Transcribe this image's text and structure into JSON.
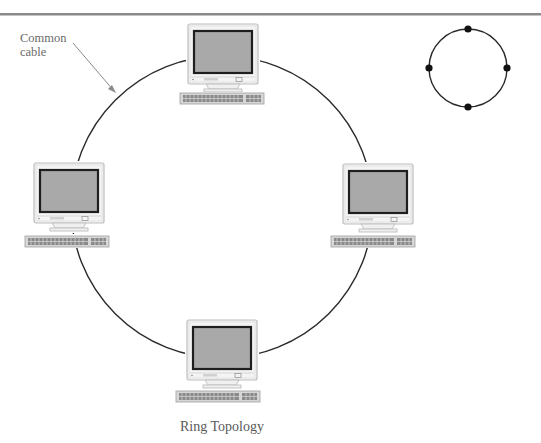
{
  "diagram": {
    "title": "Ring Topology",
    "annotation": {
      "line1": "Common",
      "line2": "cable"
    },
    "ring": {
      "cx": 222,
      "cy": 207,
      "r": 151,
      "stroke": "#2a2a2a"
    },
    "legend_icon": {
      "cx": 468,
      "cy": 68,
      "r": 39,
      "nodes": [
        [
          468,
          29
        ],
        [
          429,
          68
        ],
        [
          507,
          68
        ],
        [
          468,
          107
        ]
      ]
    },
    "computers": [
      {
        "id": "top",
        "x": 188,
        "y": 24,
        "kbx": 180
      },
      {
        "id": "left",
        "x": 36,
        "y": 163,
        "kbx": 25
      },
      {
        "id": "right",
        "x": 343,
        "y": 164,
        "kbx": 331
      },
      {
        "id": "bottom",
        "x": 187,
        "y": 320,
        "kbx": 176
      }
    ],
    "colors": {
      "rule": "#8a8a8a",
      "bezel": "#f2f2f2",
      "bezel_edge": "#bdbdbd",
      "screen": "#a9a9a9",
      "screen_border": "#1e1e1e",
      "keyboard": "#b5b5b5",
      "keyboard_keys": "#6e6e6e"
    }
  }
}
